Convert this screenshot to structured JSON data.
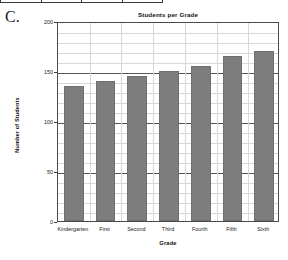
{
  "problem": {
    "letter": "C."
  },
  "table_fragment": {
    "cells": [
      "",
      "",
      "",
      ""
    ]
  },
  "chart_data": {
    "type": "bar",
    "title": "Students per Grade",
    "xlabel": "Grade",
    "ylabel": "Number of Students",
    "categories": [
      "Kindergarten",
      "First",
      "Second",
      "Third",
      "Fourth",
      "Fifth",
      "Sixth"
    ],
    "values": [
      135,
      140,
      145,
      150,
      155,
      165,
      170
    ],
    "ylim": [
      0,
      200
    ],
    "ytick_labels": [
      "0",
      "50",
      "100",
      "150",
      "200"
    ],
    "ytick_values": [
      0,
      50,
      100,
      150,
      200
    ],
    "minor_tick_step": 10,
    "grid": true,
    "legend": false,
    "bar_color": "#7d7d7d",
    "bar_edge_color": "#6f6f6f",
    "grid_major_color": "#555555",
    "grid_minor_color": "#d8d8d8",
    "axis_color": "#4a4a4a",
    "background": "#ffffff"
  }
}
